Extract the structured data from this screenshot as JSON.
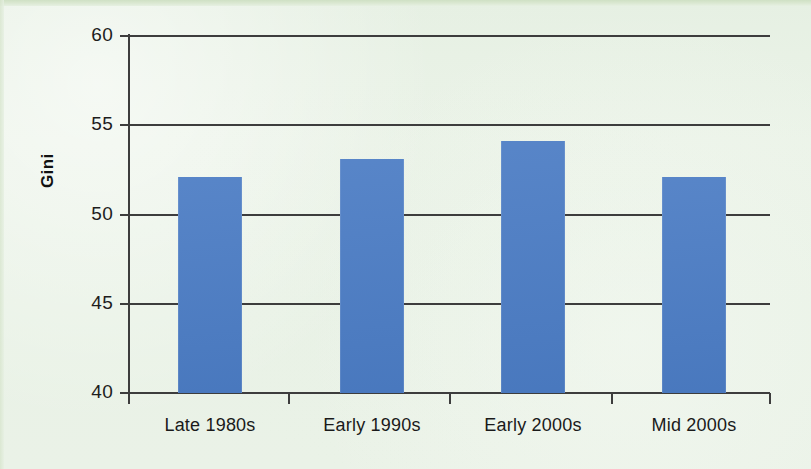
{
  "figure": {
    "background_color": "#e9f2e6",
    "bar_color": "#4b7cc4",
    "axis_color": "#3d3d3d",
    "text_color": "#1a1a1a"
  },
  "axis": {
    "y_title": "Gini",
    "y_ticks": [
      "40",
      "45",
      "50",
      "55",
      "60"
    ]
  },
  "categories": [
    {
      "label": "Late 1980s"
    },
    {
      "label": "Early 1990s"
    },
    {
      "label": "Early 2000s"
    },
    {
      "label": "Mid 2000s"
    }
  ],
  "chart_data": {
    "type": "bar",
    "title": "",
    "subtitle": "",
    "xlabel": "",
    "ylabel": "Gini",
    "categories": [
      "Late 1980s",
      "Early 1990s",
      "Early 2000s",
      "Mid 2000s"
    ],
    "values": [
      52.1,
      53.1,
      54.1,
      52.1
    ],
    "ylim": [
      40,
      60
    ],
    "yticks": [
      40,
      45,
      50,
      55,
      60
    ],
    "grid": "horizontal",
    "legend": "none",
    "bar_color": "#4b7cc4",
    "annotations": []
  }
}
